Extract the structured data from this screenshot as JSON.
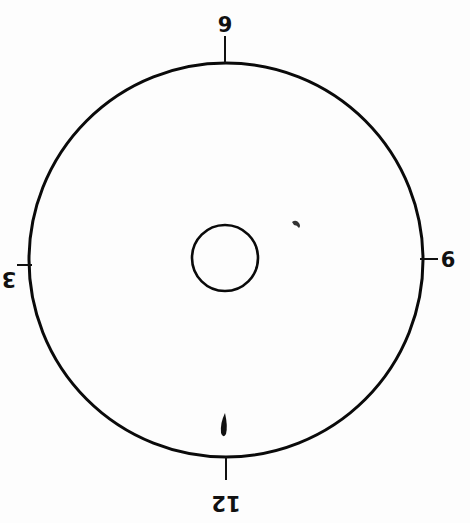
{
  "diagram": {
    "type": "clock-face",
    "orientation": "rotated-180",
    "outer_circle": {
      "cx": 226,
      "cy": 260,
      "r": 197,
      "stroke": "#0a0a0a"
    },
    "inner_circle": {
      "cx": 225,
      "cy": 258,
      "r": 33,
      "stroke": "#0a0a0a"
    },
    "labels": [
      {
        "text": "9",
        "position": "top"
      },
      {
        "text": "6",
        "position": "right"
      },
      {
        "text": "12",
        "position": "bottom"
      },
      {
        "text": "3",
        "position": "left"
      }
    ],
    "marks": [
      {
        "name": "small-curl-mark",
        "x": 296,
        "y": 224
      },
      {
        "name": "teardrop-mark",
        "x": 222,
        "y": 428
      }
    ],
    "colors": {
      "background": "#fdfdfd",
      "ink": "#111111"
    }
  }
}
